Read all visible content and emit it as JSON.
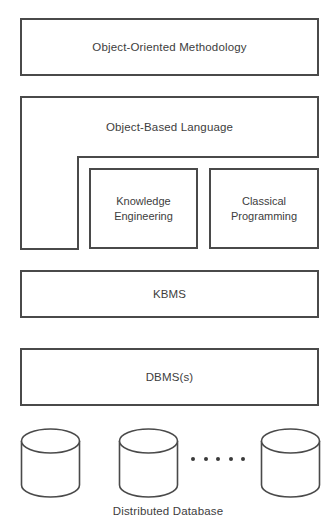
{
  "diagram": {
    "type": "layered-architecture",
    "width": 336,
    "height": 530,
    "background_color": "#ffffff",
    "stroke_color": "#4a4a4a",
    "text_color": "#3d3d3d",
    "layers": [
      {
        "label": "Object-Oriented Methodology"
      },
      {
        "label": "Object-Based Language"
      },
      {
        "label": "KBMS"
      },
      {
        "label": "DBMS(s)"
      }
    ],
    "inner_boxes": [
      {
        "label": "Knowledge Engineering",
        "line1": "Knowledge",
        "line2": "Engineering"
      },
      {
        "label": "Classical Programming",
        "line1": "Classical",
        "line2": "Programming"
      }
    ],
    "storage": {
      "caption": "Distributed Database",
      "cylinder_count": 3,
      "ellipsis_dot_count": 5,
      "cylinders": [
        {
          "name": "database-cylinder-1"
        },
        {
          "name": "database-cylinder-2"
        },
        {
          "name": "database-cylinder-3"
        }
      ]
    }
  }
}
